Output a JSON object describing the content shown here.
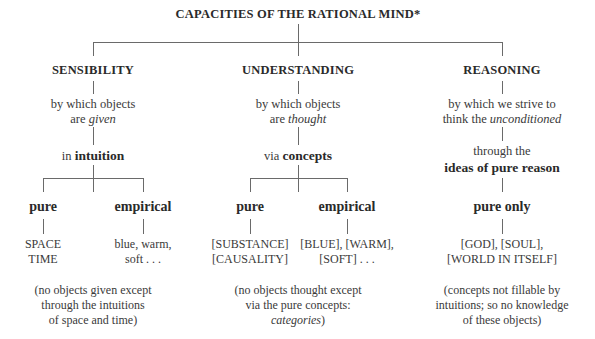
{
  "title": "CAPACITIES OF THE RATIONAL MIND*",
  "columns": [
    {
      "heading": "SENSIBILITY",
      "desc_line1": "by which objects",
      "desc_line2_prefix": "are ",
      "desc_line2_italic": "given",
      "mode_prefix": "in ",
      "mode_bold": "intuition",
      "branches": [
        {
          "label": "pure",
          "items": [
            "SPACE",
            "TIME"
          ]
        },
        {
          "label": "empirical",
          "items": [
            "blue, warm,",
            "soft . . ."
          ]
        }
      ],
      "note": [
        "(no objects given except",
        "through the intuitions",
        "of space and time)"
      ]
    },
    {
      "heading": "UNDERSTANDING",
      "desc_line1": "by which objects",
      "desc_line2_prefix": "are ",
      "desc_line2_italic": "thought",
      "mode_prefix": "via ",
      "mode_bold": "concepts",
      "branches": [
        {
          "label": "pure",
          "items": [
            "[SUBSTANCE]",
            "[CAUSALITY]"
          ]
        },
        {
          "label": "empirical",
          "items": [
            "[BLUE], [WARM],",
            "[SOFT] . . ."
          ]
        }
      ],
      "note": [
        "(no objects thought except",
        "via the pure concepts:",
        "categories",
        ")"
      ]
    },
    {
      "heading": "REASONING",
      "desc_line1": "by which we strive to",
      "desc_line2_prefix": "think the ",
      "desc_line2_italic": "unconditioned",
      "mode_line1": "through the",
      "mode_bold": "ideas of pure reason",
      "branches": [
        {
          "label": "pure only",
          "items": [
            "[GOD], [SOUL],",
            "[WORLD IN ITSELF]"
          ]
        }
      ],
      "note": [
        "(concepts not fillable by",
        "intuitions; so no knowledge",
        "of these objects)"
      ]
    }
  ]
}
